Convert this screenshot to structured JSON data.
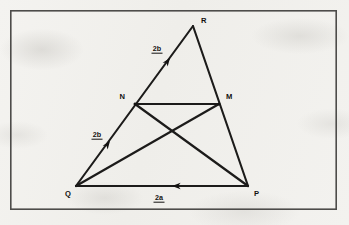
{
  "figure": {
    "type": "geometry-vector-diagram",
    "background_color": "#f2f1ee",
    "ink_color": "#1c1b1a",
    "frame": {
      "name": "diagram-border",
      "color": "#4d4c4a",
      "x": 10,
      "y": 10,
      "width": 327,
      "height": 200
    },
    "vertices": [
      {
        "id": "Q",
        "label": "Q",
        "x": 76,
        "y": 186,
        "label_x": 68,
        "label_y": 196
      },
      {
        "id": "R",
        "label": "R",
        "x": 193,
        "y": 26,
        "label_x": 201,
        "label_y": 23
      },
      {
        "id": "P",
        "label": "P",
        "x": 248,
        "y": 186,
        "label_x": 254,
        "label_y": 196
      },
      {
        "id": "N",
        "label": "N",
        "x": 135,
        "y": 104,
        "label_x": 125,
        "label_y": 99
      },
      {
        "id": "M",
        "label": "M",
        "x": 219,
        "y": 104,
        "label_x": 226,
        "label_y": 99
      }
    ],
    "edges": [
      {
        "name": "edge-QR",
        "from": "Q",
        "to": "R"
      },
      {
        "name": "edge-RP",
        "from": "R",
        "to": "P"
      },
      {
        "name": "edge-PQ",
        "from": "P",
        "to": "Q"
      },
      {
        "name": "segment-NM",
        "from": "N",
        "to": "M"
      },
      {
        "name": "cevian-QM",
        "from": "Q",
        "to": "M"
      },
      {
        "name": "cevian-PN",
        "from": "P",
        "to": "N"
      }
    ],
    "vector_labels": [
      {
        "name": "vector-2b-lower",
        "text": "2b",
        "x": 97,
        "y": 137,
        "underline": true,
        "on_edge": "edge-QR",
        "arrow_at_x": 110,
        "arrow_at_y": 141,
        "arrow_angle_deg": -53.8
      },
      {
        "name": "vector-2b-upper",
        "text": "2b",
        "x": 157,
        "y": 51,
        "underline": true,
        "on_edge": "edge-QR",
        "arrow_at_x": 170,
        "arrow_at_y": 58,
        "arrow_angle_deg": -53.8
      },
      {
        "name": "vector-2a-base",
        "text": "2a",
        "x": 159,
        "y": 200,
        "underline": true,
        "on_edge": "edge-PQ",
        "arrow_at_x": 172,
        "arrow_at_y": 186,
        "arrow_angle_deg": 180
      }
    ]
  }
}
